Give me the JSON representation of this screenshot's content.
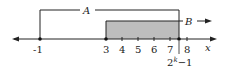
{
  "diagram": {
    "type": "number-line-intervals",
    "axis_label": "x",
    "ticks": [
      {
        "value": "-1",
        "x": 40,
        "marked": true
      },
      {
        "value": "3",
        "x": 106,
        "marked": true
      },
      {
        "value": "4",
        "x": 122
      },
      {
        "value": "5",
        "x": 138
      },
      {
        "value": "6",
        "x": 154
      },
      {
        "value": "7",
        "x": 170
      },
      {
        "value": "8",
        "x": 187
      }
    ],
    "special_point": {
      "label_base": "2",
      "label_exp": "k",
      "label_tail": "−1",
      "x": 179
    },
    "intervals": [
      {
        "name": "A",
        "from": "-1",
        "to": "2^k-1",
        "style": "bracket"
      },
      {
        "name": "B",
        "from": "3",
        "to": "infinity",
        "style": "shaded-arrow"
      }
    ],
    "colors": {
      "shade": "#bdbdbd",
      "line": "#222222"
    }
  }
}
